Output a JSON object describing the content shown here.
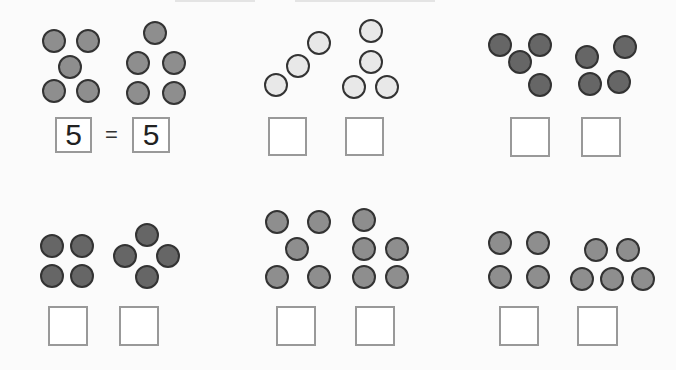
{
  "worksheet": {
    "colors": {
      "medium": "#8e8e8e",
      "light": "#e8e8e8",
      "dark": "#666666",
      "outline": "#333333",
      "box_border": "#999999"
    },
    "problems": [
      {
        "id": 1,
        "shade": "medium",
        "left_count": 5,
        "right_count": 5,
        "left_answer": "5",
        "right_answer": "5",
        "operator": "=",
        "left_dots": [
          [
            54,
            41
          ],
          [
            88,
            41
          ],
          [
            70,
            67
          ],
          [
            54,
            91
          ],
          [
            88,
            91
          ]
        ],
        "right_dots": [
          [
            155,
            33
          ],
          [
            138,
            63
          ],
          [
            174,
            63
          ],
          [
            138,
            93
          ],
          [
            174,
            93
          ]
        ],
        "radius": 12,
        "left_box": [
          55,
          117,
          37,
          36
        ],
        "right_box": [
          132,
          117,
          38,
          36
        ]
      },
      {
        "id": 2,
        "shade": "light",
        "left_count": 3,
        "right_count": 4,
        "left_answer": "",
        "right_answer": "",
        "left_dots": [
          [
            276,
            85
          ],
          [
            298,
            66
          ],
          [
            319,
            43
          ]
        ],
        "right_dots": [
          [
            371,
            31
          ],
          [
            371,
            62
          ],
          [
            354,
            87
          ],
          [
            387,
            87
          ]
        ],
        "radius": 12,
        "left_box": [
          268,
          117,
          39,
          39
        ],
        "right_box": [
          345,
          117,
          39,
          39
        ]
      },
      {
        "id": 3,
        "shade": "dark",
        "left_count": 4,
        "right_count": 4,
        "left_answer": "",
        "right_answer": "",
        "left_dots": [
          [
            500,
            45
          ],
          [
            540,
            45
          ],
          [
            520,
            62
          ],
          [
            540,
            85
          ]
        ],
        "right_dots": [
          [
            587,
            57
          ],
          [
            625,
            47
          ],
          [
            590,
            84
          ],
          [
            619,
            82
          ]
        ],
        "radius": 12,
        "left_box": [
          510,
          117,
          40,
          40
        ],
        "right_box": [
          581,
          117,
          40,
          40
        ]
      },
      {
        "id": 4,
        "shade": "dark",
        "left_count": 4,
        "right_count": 4,
        "left_answer": "",
        "right_answer": "",
        "left_dots": [
          [
            52,
            246
          ],
          [
            82,
            246
          ],
          [
            52,
            276
          ],
          [
            82,
            276
          ]
        ],
        "right_dots": [
          [
            147,
            235
          ],
          [
            125,
            256
          ],
          [
            168,
            256
          ],
          [
            147,
            277
          ]
        ],
        "radius": 12,
        "left_box": [
          48,
          306,
          40,
          40
        ],
        "right_box": [
          119,
          306,
          40,
          40
        ]
      },
      {
        "id": 5,
        "shade": "medium",
        "left_count": 5,
        "right_count": 5,
        "left_answer": "",
        "right_answer": "",
        "left_dots": [
          [
            277,
            222
          ],
          [
            319,
            222
          ],
          [
            297,
            249
          ],
          [
            277,
            277
          ],
          [
            319,
            277
          ]
        ],
        "right_dots": [
          [
            364,
            220
          ],
          [
            364,
            249
          ],
          [
            397,
            249
          ],
          [
            364,
            277
          ],
          [
            397,
            277
          ]
        ],
        "radius": 12,
        "left_box": [
          276,
          306,
          40,
          40
        ],
        "right_box": [
          355,
          306,
          40,
          40
        ]
      },
      {
        "id": 6,
        "shade": "medium",
        "left_count": 4,
        "right_count": 5,
        "left_answer": "",
        "right_answer": "",
        "left_dots": [
          [
            500,
            243
          ],
          [
            538,
            243
          ],
          [
            500,
            277
          ],
          [
            538,
            277
          ]
        ],
        "right_dots": [
          [
            596,
            250
          ],
          [
            628,
            250
          ],
          [
            582,
            279
          ],
          [
            612,
            279
          ],
          [
            643,
            279
          ]
        ],
        "radius": 12,
        "left_box": [
          499,
          306,
          40,
          40
        ],
        "right_box": [
          577,
          306,
          41,
          40
        ]
      }
    ]
  }
}
